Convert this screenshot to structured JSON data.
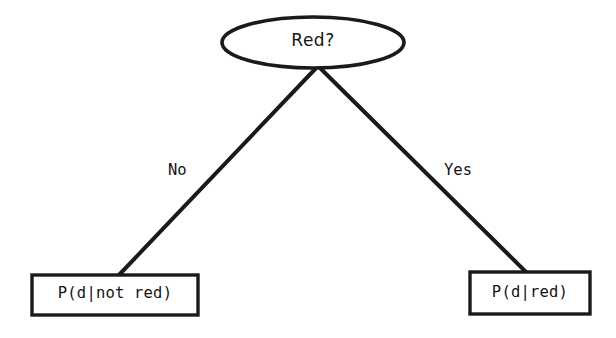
{
  "diagram": {
    "type": "decision-tree",
    "title": "Red?",
    "colors": {
      "stroke": "#1a1a1a",
      "background": "#ffffff",
      "text": "#141414"
    },
    "root": {
      "shape": "ellipse",
      "label": "Red?"
    },
    "edges": [
      {
        "id": "no",
        "label": "No",
        "from": "Red?",
        "to": "P(d|not red)"
      },
      {
        "id": "yes",
        "label": "Yes",
        "from": "Red?",
        "to": "P(d|red)"
      }
    ],
    "leaves": [
      {
        "id": "left",
        "shape": "rectangle",
        "label": "P(d|not red)"
      },
      {
        "id": "right",
        "shape": "rectangle",
        "label": "P(d|red)"
      }
    ]
  }
}
